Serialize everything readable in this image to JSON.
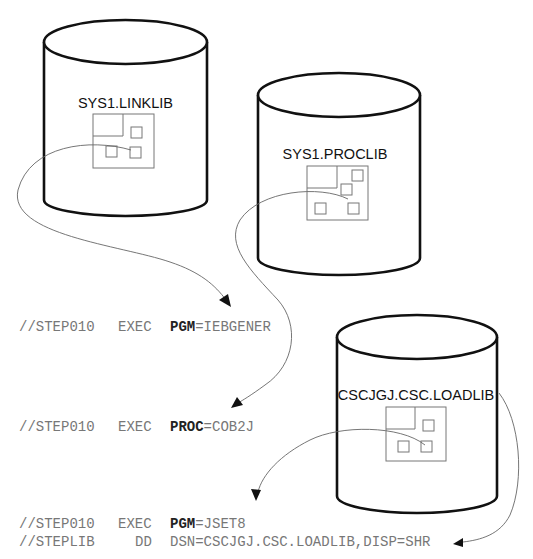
{
  "datasets": [
    {
      "id": "linklib",
      "label": "SYS1.LINKLIB"
    },
    {
      "id": "proclib",
      "label": "SYS1.PROCLIB"
    },
    {
      "id": "loadlib",
      "label": "CSCJGJ.CSC.LOADLIB"
    }
  ],
  "jcl": [
    {
      "name": "//STEP010",
      "op": "EXEC",
      "keyword": "PGM",
      "value": "=IEBGENER"
    },
    {
      "name": "//STEP010",
      "op": "EXEC",
      "keyword": "PROC",
      "value": "=COB2J"
    },
    {
      "name": "//STEP010",
      "op": "EXEC",
      "keyword": "PGM",
      "value": "=JSET8"
    },
    {
      "name": "//STEPLIB",
      "op": "DD",
      "keyword": "",
      "value": "DSN=CSCJGJ.CSC.LOADLIB,DISP=SHR"
    }
  ],
  "colors": {
    "cylinder_stroke": "#111111",
    "member_stroke": "#777777",
    "jcl_text": "#777777",
    "arrow": "#111111"
  }
}
